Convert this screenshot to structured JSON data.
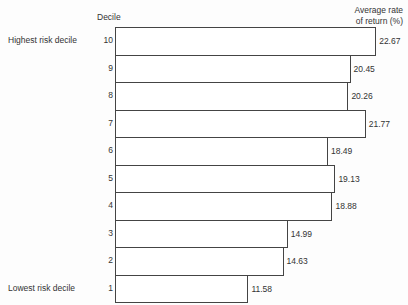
{
  "chart_data": {
    "type": "bar",
    "orientation": "horizontal",
    "title": "",
    "xlabel": "Average rate of return (%)",
    "ylabel": "Decile",
    "categories": [
      "10",
      "9",
      "8",
      "7",
      "6",
      "5",
      "4",
      "3",
      "2",
      "1"
    ],
    "values": [
      22.67,
      20.45,
      20.26,
      21.77,
      18.49,
      19.13,
      18.88,
      14.99,
      14.63,
      11.58
    ],
    "value_labels": [
      "22.67",
      "20.45",
      "20.26",
      "21.77",
      "18.49",
      "19.13",
      "18.88",
      "14.99",
      "14.63",
      "11.58"
    ],
    "annotations": [
      {
        "category": "10",
        "text": "Highest risk decile"
      },
      {
        "category": "1",
        "text": "Lowest risk decile"
      }
    ],
    "grid": false,
    "legend": null
  },
  "headers": {
    "decile": "Decile",
    "rate_line1": "Average rate",
    "rate_line2": "of return (%)"
  },
  "side_labels": {
    "highest": "Highest risk decile",
    "lowest": "Lowest risk decile"
  }
}
